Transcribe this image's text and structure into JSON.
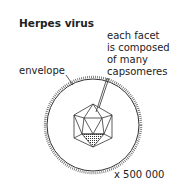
{
  "title": "Herpes virus",
  "labels": {
    "facet": [
      "each facet",
      "is composed",
      "of many",
      "capsomeres"
    ],
    "envelope": "envelope",
    "magnification": "x 500 000"
  }
}
